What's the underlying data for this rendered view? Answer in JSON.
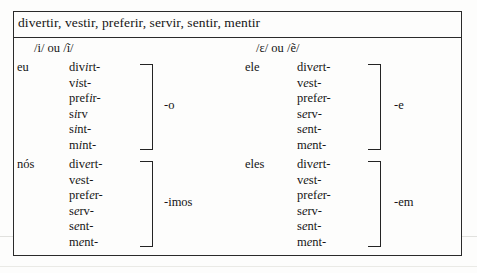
{
  "table": {
    "header": "divertir, vestir, preferir, servir, sentir, mentir",
    "phonetic_left": "/i/ ou /ĩ/",
    "phonetic_right": "/ɛ/ ou /ẽ/",
    "blocks": [
      {
        "id": "eu",
        "pronoun": "eu",
        "suffix": "-o",
        "stems": [
          {
            "pre": "div",
            "vowel": "i",
            "post": "rt-"
          },
          {
            "pre": "v",
            "vowel": "i",
            "post": "st-"
          },
          {
            "pre": "pref",
            "vowel": "i",
            "post": "r-"
          },
          {
            "pre": "s",
            "vowel": "i",
            "post": "rv"
          },
          {
            "pre": "s",
            "vowel": "i",
            "post": "nt-"
          },
          {
            "pre": "m",
            "vowel": "i",
            "post": "nt-"
          }
        ]
      },
      {
        "id": "ele",
        "pronoun": "ele",
        "suffix": "-e",
        "stems": [
          {
            "pre": "div",
            "vowel": "e",
            "post": "rt-"
          },
          {
            "pre": "v",
            "vowel": "e",
            "post": "st-"
          },
          {
            "pre": "pref",
            "vowel": "e",
            "post": "r-"
          },
          {
            "pre": "s",
            "vowel": "e",
            "post": "rv-"
          },
          {
            "pre": "s",
            "vowel": "e",
            "post": "nt-"
          },
          {
            "pre": "m",
            "vowel": "e",
            "post": "nt-"
          }
        ]
      },
      {
        "id": "nos",
        "pronoun": "nós",
        "suffix": "-imos",
        "stems": [
          {
            "pre": "div",
            "vowel": "e",
            "post": "rt-"
          },
          {
            "pre": "v",
            "vowel": "e",
            "post": "st-"
          },
          {
            "pre": "pref",
            "vowel": "e",
            "post": "r-"
          },
          {
            "pre": "s",
            "vowel": "e",
            "post": "rv-"
          },
          {
            "pre": "s",
            "vowel": "e",
            "post": "nt-"
          },
          {
            "pre": "m",
            "vowel": "e",
            "post": "nt-"
          }
        ]
      },
      {
        "id": "eles",
        "pronoun": "eles",
        "suffix": "-em",
        "stems": [
          {
            "pre": "div",
            "vowel": "e",
            "post": "rt-"
          },
          {
            "pre": "v",
            "vowel": "e",
            "post": "st-"
          },
          {
            "pre": "pref",
            "vowel": "e",
            "post": "r-"
          },
          {
            "pre": "s",
            "vowel": "e",
            "post": "rv-"
          },
          {
            "pre": "s",
            "vowel": "e",
            "post": "nt-"
          },
          {
            "pre": "m",
            "vowel": "e",
            "post": "nt-"
          }
        ]
      }
    ]
  }
}
